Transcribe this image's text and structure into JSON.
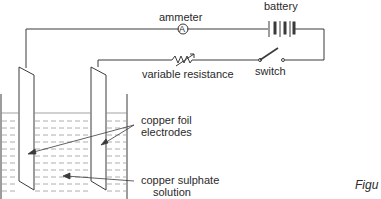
{
  "labels": {
    "ammeter": "ammeter",
    "ammeter_symbol": "A",
    "battery": "battery",
    "variable_resistance": "variable resistance",
    "switch": "switch",
    "electrodes_line1": "copper foil",
    "electrodes_line2": "electrodes",
    "solution_line1": "copper sulphate",
    "solution_line2": "solution",
    "figure_caption": "Figu"
  },
  "colors": {
    "line": "#3a3a3a",
    "liquid_dash": "#8a8a8a",
    "background": "#ffffff"
  }
}
